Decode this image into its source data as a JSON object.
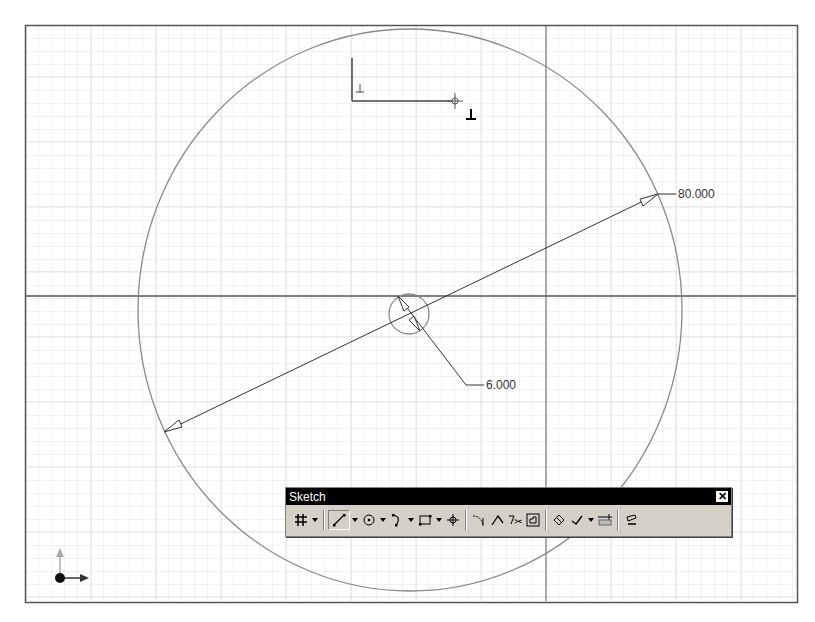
{
  "viewport": {
    "frame": {
      "x": 25,
      "y": 25,
      "w": 772,
      "h": 577
    },
    "grid": {
      "minor_spacing": 13,
      "color": "#e4e4e4"
    },
    "axes": {
      "x_axis_y": 296,
      "y_axis_x": 546,
      "color": "#555555"
    }
  },
  "sketch": {
    "outer_circle": {
      "cx": 410,
      "cy": 310,
      "rx": 272,
      "ry": 281,
      "color": "#8a8a8a"
    },
    "inner_circle": {
      "cx": 409,
      "cy": 314,
      "r": 20,
      "color": "#8a8a8a"
    },
    "dimensions": [
      {
        "name": "outer-diameter",
        "value": "80.000",
        "label_x": 678,
        "label_y": 189
      },
      {
        "name": "inner-diameter",
        "value": "6.000",
        "label_x": 486,
        "label_y": 382
      }
    ]
  },
  "sketch_toolbar": {
    "title": "Sketch",
    "close_label": "✕",
    "tools": [
      {
        "name": "grid-icon",
        "has_dropdown": true
      },
      {
        "name": "line-icon",
        "has_dropdown": true,
        "active": true
      },
      {
        "name": "circle-icon",
        "has_dropdown": true
      },
      {
        "name": "arc-icon",
        "has_dropdown": true
      },
      {
        "name": "rectangle-icon",
        "has_dropdown": true
      },
      {
        "name": "point-icon",
        "has_dropdown": false
      },
      {
        "name": "fillet-icon",
        "has_dropdown": false
      },
      {
        "name": "extend-icon",
        "has_dropdown": false
      },
      {
        "name": "trim-icon",
        "has_dropdown": false
      },
      {
        "name": "offset-icon",
        "has_dropdown": false
      },
      {
        "name": "constraint-icon",
        "has_dropdown": false
      },
      {
        "name": "check-constraint-icon",
        "has_dropdown": true
      },
      {
        "name": "dimension-icon",
        "has_dropdown": false
      },
      {
        "name": "eraser-icon",
        "has_dropdown": false
      }
    ]
  },
  "triad": {
    "origin_x": 60,
    "origin_y": 578
  }
}
